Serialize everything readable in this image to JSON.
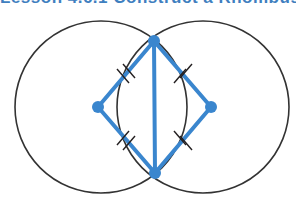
{
  "canvas": {
    "width": 296,
    "height": 198,
    "background": "#ffffff"
  },
  "heading": {
    "text": "Lesson 4.6.1  Construct a Rhombus",
    "note": "top heading row is cut off at the top edge of the screenshot; only the lower few pixels of the glyphs are visible",
    "color": "#3f7fbf"
  },
  "figure": {
    "stroke_black": "#333333",
    "stroke_blue": "#3a86ce",
    "vertex_fill": "#3a86ce",
    "circle_stroke_width": 1.6,
    "blue_stroke_width": 4,
    "tick_stroke_width": 1.4,
    "tick_color": "#231f20",
    "circles": [
      {
        "name": "left-circle",
        "cx": 101,
        "cy": 107,
        "r": 86
      },
      {
        "name": "right-circle",
        "cx": 203,
        "cy": 107,
        "r": 86
      }
    ],
    "vertices": [
      {
        "name": "top-intersection-point",
        "label": "B",
        "x": 154,
        "y": 41,
        "r": 6
      },
      {
        "name": "left-center-point",
        "label": "A",
        "x": 98,
        "y": 107,
        "r": 6
      },
      {
        "name": "right-center-point",
        "label": "C",
        "x": 211,
        "y": 107,
        "r": 6
      },
      {
        "name": "bottom-intersection-point",
        "label": "D",
        "x": 155,
        "y": 173,
        "r": 6
      }
    ],
    "edges": [
      {
        "name": "edge-top-left",
        "from": "top-intersection-point",
        "to": "left-center-point",
        "x1": 154,
        "y1": 41,
        "x2": 98,
        "y2": 107,
        "ticks": 2
      },
      {
        "name": "edge-top-right",
        "from": "top-intersection-point",
        "to": "right-center-point",
        "x1": 154,
        "y1": 41,
        "x2": 211,
        "y2": 107,
        "ticks": 2
      },
      {
        "name": "edge-bottom-left",
        "from": "left-center-point",
        "to": "bottom-intersection-point",
        "x1": 98,
        "y1": 107,
        "x2": 155,
        "y2": 173,
        "ticks": 2
      },
      {
        "name": "edge-bottom-right",
        "from": "right-center-point",
        "to": "bottom-intersection-point",
        "x1": 211,
        "y1": 107,
        "x2": 155,
        "y2": 173,
        "ticks": 2
      },
      {
        "name": "diagonal-vertical",
        "from": "top-intersection-point",
        "to": "bottom-intersection-point",
        "x1": 154,
        "y1": 41,
        "x2": 155,
        "y2": 173,
        "ticks": 0
      }
    ],
    "tick_marks": [
      {
        "name": "tick-mark-top-left-a",
        "x1": 117,
        "y1": 69,
        "x2": 129,
        "y2": 83
      },
      {
        "name": "tick-mark-top-left-b",
        "x1": 123,
        "y1": 64,
        "x2": 135,
        "y2": 78
      },
      {
        "name": "tick-mark-top-right-a",
        "x1": 174,
        "y1": 83,
        "x2": 186,
        "y2": 69
      },
      {
        "name": "tick-mark-top-right-b",
        "x1": 180,
        "y1": 78,
        "x2": 192,
        "y2": 64
      },
      {
        "name": "tick-mark-bottom-left-a",
        "x1": 117,
        "y1": 145,
        "x2": 129,
        "y2": 131
      },
      {
        "name": "tick-mark-bottom-left-b",
        "x1": 123,
        "y1": 150,
        "x2": 135,
        "y2": 136
      },
      {
        "name": "tick-mark-bottom-right-a",
        "x1": 174,
        "y1": 131,
        "x2": 186,
        "y2": 145
      },
      {
        "name": "tick-mark-bottom-right-b",
        "x1": 180,
        "y1": 136,
        "x2": 192,
        "y2": 150
      }
    ]
  }
}
